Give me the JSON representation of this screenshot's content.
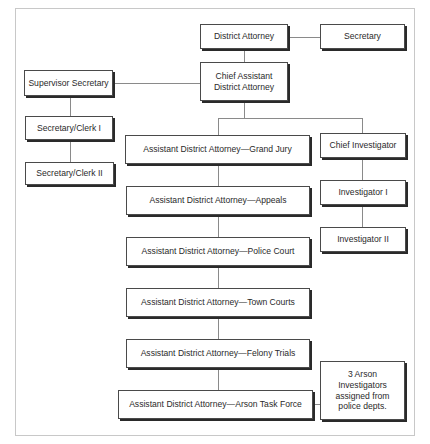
{
  "chart": {
    "nodes": {
      "district_attorney": "District Attorney",
      "secretary": "Secretary",
      "chief_assistant_line1": "Chief Assistant",
      "chief_assistant_line2": "District Attorney",
      "supervisor_secretary": "Supervisor Secretary",
      "secretary_clerk_1": "Secretary/Clerk I",
      "secretary_clerk_2": "Secretary/Clerk II",
      "ada_grand_jury": "Assistant District Attorney—Grand Jury",
      "ada_appeals": "Assistant District Attorney—Appeals",
      "ada_police_court": "Assistant District Attorney—Police Court",
      "ada_town_courts": "Assistant District Attorney—Town Courts",
      "ada_felony_trials": "Assistant District Attorney—Felony Trials",
      "ada_arson_task_force": "Assistant District Attorney—Arson Task Force",
      "chief_investigator": "Chief Investigator",
      "investigator_1": "Investigator I",
      "investigator_2": "Investigator II",
      "arson_investigators_line1": "3 Arson",
      "arson_investigators_line2": "Investigators",
      "arson_investigators_line3": "assigned from",
      "arson_investigators_line4": "police depts."
    }
  }
}
